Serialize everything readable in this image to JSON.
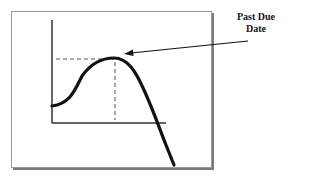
{
  "diagram": {
    "annotation": {
      "line1": "Past Due",
      "line2": "Date"
    },
    "colors": {
      "curve": "#111111",
      "axes": "#333333",
      "frame": "#9a9a9a",
      "shadow": "#7a7a7a",
      "dashed": "#555555"
    }
  }
}
